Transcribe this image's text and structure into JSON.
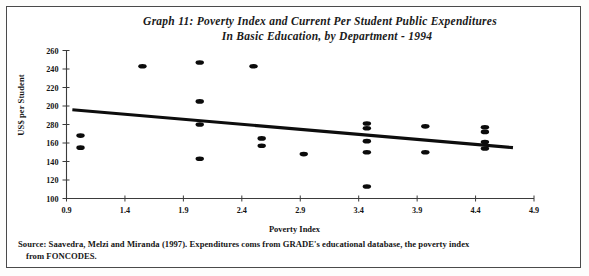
{
  "figure": {
    "title_line_1": "Graph 11:  Poverty Index and Current Per  Student Public Expenditures",
    "title_line_2": "In Basic Education, by Department - 1994",
    "source_line_1": "Source: Saavedra, Melzi and Miranda (1997).  Expenditures coms from  GRADE's educational database, the poverty index",
    "source_line_2": "from FONCODES."
  },
  "chart_data": {
    "type": "scatter",
    "title": "Graph 11:  Poverty Index and Current Per Student Public Expenditures In Basic Education, by Department - 1994",
    "xlabel": "Poverty Index",
    "ylabel": "US$ per Student",
    "xlim": [
      0.9,
      4.9
    ],
    "ylim": [
      100,
      260
    ],
    "grid": false,
    "legend": null,
    "xticks": [
      "0.9",
      "1.4",
      "1.9",
      "2.4",
      "2.9",
      "3.4",
      "3.9",
      "4.4",
      "4.9"
    ],
    "yticks": [
      "260",
      "240",
      "220",
      "200",
      "280",
      "160",
      "140",
      "120",
      "100"
    ],
    "ytick_values": [
      260,
      240,
      220,
      200,
      180,
      160,
      140,
      120,
      100
    ],
    "points": [
      {
        "x": 1.02,
        "y": 168
      },
      {
        "x": 1.02,
        "y": 155
      },
      {
        "x": 1.55,
        "y": 243
      },
      {
        "x": 2.04,
        "y": 247
      },
      {
        "x": 2.04,
        "y": 205
      },
      {
        "x": 2.04,
        "y": 180
      },
      {
        "x": 2.04,
        "y": 143
      },
      {
        "x": 2.5,
        "y": 243
      },
      {
        "x": 2.57,
        "y": 165
      },
      {
        "x": 2.57,
        "y": 157
      },
      {
        "x": 2.93,
        "y": 148
      },
      {
        "x": 3.47,
        "y": 181
      },
      {
        "x": 3.47,
        "y": 176
      },
      {
        "x": 3.47,
        "y": 162
      },
      {
        "x": 3.47,
        "y": 150
      },
      {
        "x": 3.47,
        "y": 113
      },
      {
        "x": 3.97,
        "y": 178
      },
      {
        "x": 3.97,
        "y": 150
      },
      {
        "x": 4.48,
        "y": 177
      },
      {
        "x": 4.48,
        "y": 172
      },
      {
        "x": 4.48,
        "y": 161
      },
      {
        "x": 4.48,
        "y": 154
      }
    ],
    "trend_line": {
      "x_start": 0.95,
      "y_start": 196,
      "x_end": 4.72,
      "y_end": 155
    }
  }
}
